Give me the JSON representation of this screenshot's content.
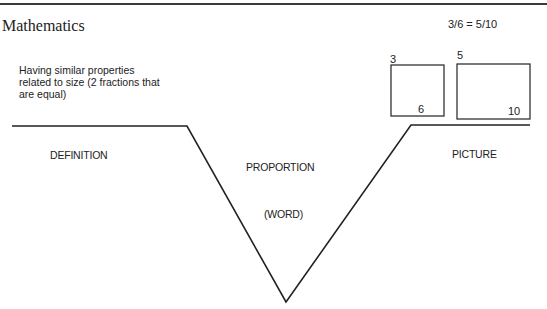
{
  "header": {
    "subject": "Mathematics"
  },
  "frayer_model": {
    "type": "word-v-diagram",
    "definition": {
      "heading": "DEFINITION",
      "text": "Having similar properties related to size (2 fractions that are equal)"
    },
    "word": {
      "term": "PROPORTION",
      "caption": "(WORD)"
    },
    "picture": {
      "heading": "PICTURE",
      "equation": "3/6 = 5/10",
      "boxes": [
        {
          "top_label": "3",
          "bottom_label": "6"
        },
        {
          "top_label": "5",
          "bottom_label": "10"
        }
      ]
    }
  },
  "colors": {
    "line": "#222222",
    "background": "#ffffff"
  }
}
